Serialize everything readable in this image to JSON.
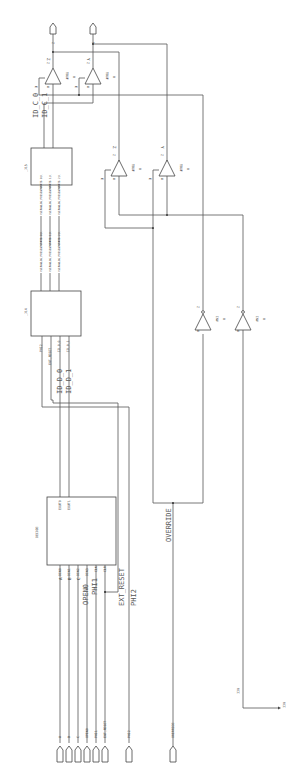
{
  "diagram": {
    "type": "schematic",
    "orientation": "rotated-90-ccw",
    "colors": {
      "wire": "#555555",
      "background": "#ffffff",
      "text": "#333333"
    }
  },
  "blocks": {
    "decode": {
      "label": "DECODE",
      "pins_in": [
        "DIN0",
        "DIN1",
        "DIN2",
        "DIN3",
        "CLK",
        "CLR"
      ],
      "pins_out": [
        "EOUT0",
        "EOUT1"
      ]
    },
    "j14": {
      "label": "_J14",
      "pins_in": [
        "PHI2",
        "EXT_RESET",
        "ID_0_0",
        "ID_0_1"
      ],
      "pins_out": [
        "\\VERANLEG_PRESENTSTATE(0)\\",
        "\\VERANLEG_PRESENTSTATE(1)\\",
        "\\VERANLEG_PRESENTSTATE(2)\\"
      ]
    },
    "j15": {
      "label": "_J15",
      "pins_in": [
        "\\VERANLEG_PRESENTSTATE(0)\\",
        "\\VERANLEG_PRESENTSTATE(1)\\",
        "\\VERANLEG_PRESENTSTATE(2)\\"
      ],
      "pins_out": [
        "ID_C_0",
        "ID_C_1"
      ]
    }
  },
  "gates": {
    "tbuf_top_z": {
      "type": "TBUF",
      "value": "0",
      "pin_a": "A",
      "pin_z": "Z",
      "pin_e": "E",
      "net": "Z"
    },
    "tbuf_top_y": {
      "type": "TBUF",
      "value": "0",
      "pin_a": "A",
      "pin_z": "Z",
      "pin_e": "E",
      "net": "Y"
    },
    "tbuf_mid_z": {
      "type": "TBUF",
      "value": "0",
      "pin_a": "A",
      "pin_z": "Z",
      "pin_e": "E",
      "net": "Z"
    },
    "tbuf_mid_y": {
      "type": "TBUF",
      "value": "0",
      "pin_a": "A",
      "pin_z": "Z",
      "pin_e": "E",
      "net": "Y"
    },
    "inv_1": {
      "type": "INV",
      "value": "0",
      "pin_a": "A",
      "pin_z": "Z"
    },
    "inv_2": {
      "type": "INV",
      "value": "0",
      "pin_a": "A",
      "pin_z": "Z"
    }
  },
  "ports": {
    "inputs": [
      "A",
      "B",
      "C",
      "OPEN0",
      "PHI1",
      "EXT_RESET"
    ],
    "phi2": "PHI2",
    "override": "OVERRIDE",
    "outputs": [
      "Z",
      "Y"
    ]
  },
  "net_labels": {
    "decode_a": "A",
    "decode_b": "B",
    "decode_c": "C",
    "open0": "OPEN0",
    "phi1": "PHI1",
    "ext_reset": "EXT_RESET",
    "phi2": "PHI2",
    "override": "OVERRIDE",
    "id_d_0": "ID_D_0",
    "id_d_1": "ID_D_1",
    "id_c_0": "ID_C_0",
    "id_c_1": "ID_C_1",
    "z": "Z",
    "y": "Y",
    "vcc": "VCC",
    "vcc_arrow": "VCC"
  }
}
